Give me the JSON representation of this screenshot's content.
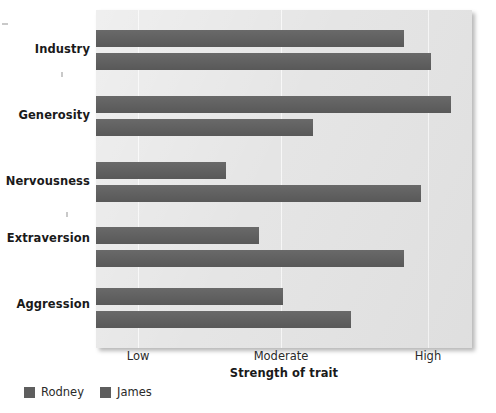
{
  "chart_data": {
    "type": "bar",
    "orientation": "horizontal",
    "title": "",
    "xlabel": "Strength of trait",
    "ylabel": "",
    "categories": [
      "Industry",
      "Generosity",
      "Nervousness",
      "Extraversion",
      "Aggression"
    ],
    "x_tick_labels": [
      "Low",
      "Moderate",
      "High"
    ],
    "x_tick_values": [
      1,
      2,
      3
    ],
    "xlim": [
      0.71,
      3.3
    ],
    "grid": "vertical-white-gridlines",
    "legend_position": "below-left",
    "series": [
      {
        "name": "Rodney",
        "color": "#5e5e5e",
        "values": [
          2.86,
          3.19,
          1.31,
          1.54,
          1.72
        ],
        "value_labels": [
          "High",
          "Very high",
          "Low",
          "Low-moderate",
          "Moderate"
        ]
      },
      {
        "name": "James",
        "color": "#5e5e5e",
        "values": [
          3.05,
          2.22,
          3.0,
          2.86,
          2.2
        ],
        "value_labels": [
          "Very high",
          "Moderate-high",
          "High",
          "High",
          "Moderate"
        ]
      }
    ]
  },
  "axis": {
    "x_title": "Strength of trait",
    "ticks": [
      {
        "label": "Low",
        "x_px": 138
      },
      {
        "label": "Moderate",
        "x_px": 281
      },
      {
        "label": "High",
        "x_px": 428
      }
    ]
  },
  "categories": [
    {
      "label": "Industry",
      "label_top_px": 42,
      "bars": [
        {
          "series": "Rodney",
          "top_px": 30,
          "end_px": 404
        },
        {
          "series": "James",
          "top_px": 53,
          "end_px": 431
        }
      ]
    },
    {
      "label": "Generosity",
      "label_top_px": 108,
      "bars": [
        {
          "series": "Rodney",
          "top_px": 96,
          "end_px": 451
        },
        {
          "series": "James",
          "top_px": 119,
          "end_px": 313
        }
      ]
    },
    {
      "label": "Nervousness",
      "label_top_px": 174,
      "bars": [
        {
          "series": "Rodney",
          "top_px": 162,
          "end_px": 226
        },
        {
          "series": "James",
          "top_px": 185,
          "end_px": 421
        }
      ]
    },
    {
      "label": "Extraversion",
      "label_top_px": 231,
      "bars": [
        {
          "series": "Rodney",
          "top_px": 227,
          "end_px": 259
        },
        {
          "series": "James",
          "top_px": 250,
          "end_px": 404
        }
      ]
    },
    {
      "label": "Aggression",
      "label_top_px": 297,
      "bars": [
        {
          "series": "Rodney",
          "top_px": 288,
          "end_px": 283
        },
        {
          "series": "James",
          "top_px": 311,
          "end_px": 351
        }
      ]
    }
  ],
  "legend": {
    "items": [
      {
        "label": "Rodney",
        "color": "#5e5e5e"
      },
      {
        "label": "James",
        "color": "#5e5e5e"
      }
    ]
  },
  "style": {
    "plot_background": "#e4e4e4",
    "gridline_color": "#f7f7f7",
    "bar_color": "#5e5e5e",
    "page_background": "#ffffff",
    "text_color": "#1a1a1a"
  },
  "geometry": {
    "plot_left_px": 96,
    "plot_top_px": 10,
    "plot_width_px": 376,
    "plot_height_px": 338,
    "bar_height_px": 17
  }
}
